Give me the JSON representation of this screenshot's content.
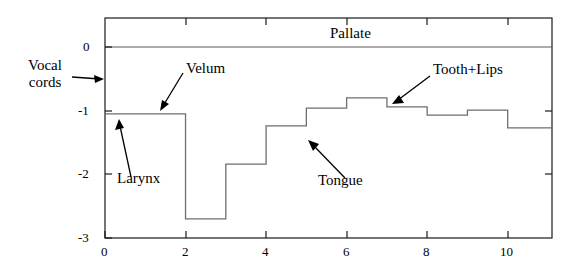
{
  "figure": {
    "title": "",
    "background": "#ffffff",
    "line_color": "#6e6e6e",
    "axis_color": "#1a1a1a"
  },
  "annotations": {
    "vocal_cords": "Vocal\ncords",
    "vocal_cords_line1": "Vocal",
    "vocal_cords_line2": "cords",
    "velum": "Velum",
    "larynx": "Larynx",
    "tongue": "Tongue",
    "pallate": "Pallate",
    "tooth_lips": "Tooth+Lips"
  },
  "axes": {
    "y_ticks": [
      "0",
      "-1",
      "-2",
      "-3"
    ],
    "y_tick_values": [
      0,
      -1,
      -2,
      -3
    ],
    "x_ticks": [
      "0",
      "2",
      "4",
      "6",
      "8",
      "10"
    ],
    "x_tick_values": [
      0,
      2,
      4,
      6,
      8,
      10
    ],
    "xlim": [
      0,
      11.1
    ],
    "ylim": [
      -3,
      0.45
    ],
    "xlabel": "",
    "ylabel": ""
  },
  "chart_data": {
    "type": "line",
    "title": "",
    "xlabel": "",
    "ylabel": "",
    "xlim": [
      0,
      11.1
    ],
    "ylim": [
      -3,
      0.45
    ],
    "grid": false,
    "legend": false,
    "series": [
      {
        "name": "Pallate",
        "style": "step-horizontal",
        "values": [
          {
            "x0": 0,
            "x1": 11.1,
            "y": 0
          }
        ]
      },
      {
        "name": "Vocal tract area (step profile)",
        "style": "step-post",
        "values": [
          {
            "x0": 0,
            "x1": 2,
            "y": -1.05
          },
          {
            "x0": 2,
            "x1": 3,
            "y": -2.7
          },
          {
            "x0": 3,
            "x1": 4,
            "y": -1.84
          },
          {
            "x0": 4,
            "x1": 5,
            "y": -1.24
          },
          {
            "x0": 5,
            "x1": 6,
            "y": -0.96
          },
          {
            "x0": 6,
            "x1": 7,
            "y": -0.8
          },
          {
            "x0": 7,
            "x1": 8,
            "y": -0.94
          },
          {
            "x0": 8,
            "x1": 9,
            "y": -1.07
          },
          {
            "x0": 9,
            "x1": 10,
            "y": -0.99
          },
          {
            "x0": 10,
            "x1": 11.1,
            "y": -1.27
          }
        ]
      }
    ],
    "annotations": [
      {
        "label": "Vocal cords",
        "points_to": [
          0,
          -0.55
        ]
      },
      {
        "label": "Velum",
        "points_to": [
          1.75,
          -1.02
        ]
      },
      {
        "label": "Larynx",
        "points_to": [
          0.45,
          -1.15
        ]
      },
      {
        "label": "Tongue",
        "points_to": [
          4.55,
          -1.2
        ]
      },
      {
        "label": "Pallate",
        "points_to": [
          5.5,
          0.0
        ]
      },
      {
        "label": "Tooth+Lips",
        "points_to": [
          7.05,
          -0.92
        ]
      }
    ]
  }
}
